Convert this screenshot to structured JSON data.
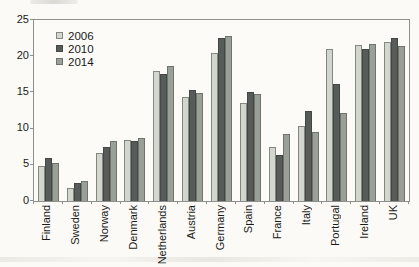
{
  "chart_data": {
    "type": "bar",
    "title": "",
    "xlabel": "",
    "ylabel": "",
    "categories": [
      "Finland",
      "Sweden",
      "Norway",
      "Denmark",
      "Netherlands",
      "Austria",
      "Germany",
      "Spain",
      "France",
      "Italy",
      "Portugal",
      "Ireland",
      "UK"
    ],
    "series": [
      {
        "name": "2006",
        "color": "#d2d6cf",
        "border_color": "#83887f",
        "values": [
          4.8,
          1.8,
          6.6,
          8.4,
          18.0,
          14.4,
          20.5,
          13.6,
          7.4,
          10.4,
          21.0,
          21.6,
          21.9
        ]
      },
      {
        "name": "2010",
        "color": "#575c5a",
        "border_color": "#434846",
        "values": [
          5.9,
          2.5,
          7.4,
          8.3,
          17.5,
          15.3,
          22.5,
          15.0,
          6.3,
          12.5,
          16.2,
          21.0,
          22.5
        ]
      },
      {
        "name": "2014",
        "color": "#9aa098",
        "border_color": "#6e736c",
        "values": [
          5.3,
          2.7,
          8.3,
          8.7,
          18.6,
          14.9,
          22.8,
          14.8,
          9.2,
          9.6,
          12.2,
          21.7,
          21.4
        ]
      }
    ],
    "ylim": [
      0,
      25
    ],
    "yticks": [
      0,
      5,
      10,
      15,
      20,
      25
    ],
    "grid": false,
    "legend_position": "top-left-inside",
    "x_label_rotation": -90
  },
  "colors": {
    "background": "#fbfaf6",
    "axis": "#8e8e8c",
    "text": "#1a1a1a"
  }
}
